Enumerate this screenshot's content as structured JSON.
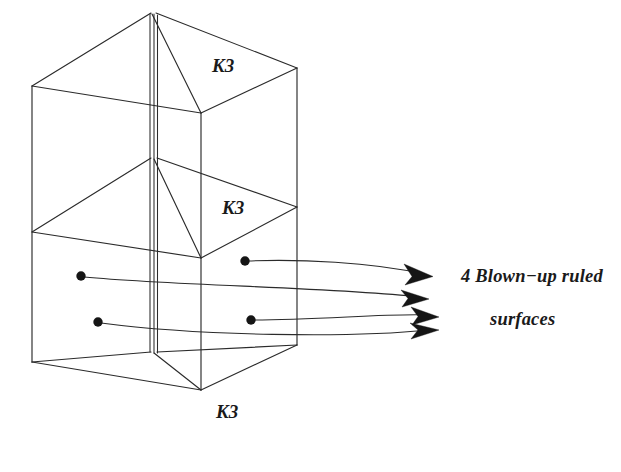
{
  "figure": {
    "name": "blown-up-ruled-surfaces-degeneration-diagram",
    "background_color": "#ffffff",
    "ink_color": "#2b2b2b",
    "width": 621,
    "height": 472
  },
  "labels": {
    "k3_top": "K3",
    "k3_middle": "K3",
    "k3_bottom": "K3",
    "callout_line1": "4 Blown−up ruled",
    "callout_line2": "surfaces"
  },
  "annotation": {
    "count": 4,
    "dot_count": 4,
    "arrow_count": 4,
    "dots": [
      {
        "id": "dot-upper-right",
        "x": 245,
        "y": 261
      },
      {
        "id": "dot-upper-left",
        "x": 81,
        "y": 276
      },
      {
        "id": "dot-lower-left",
        "x": 98,
        "y": 322
      },
      {
        "id": "dot-lower-right",
        "x": 251,
        "y": 320
      }
    ],
    "arrow_tips": [
      {
        "id": "arrow-tip-1",
        "x": 431,
        "y": 275
      },
      {
        "id": "arrow-tip-2",
        "x": 427,
        "y": 298
      },
      {
        "id": "arrow-tip-3",
        "x": 437,
        "y": 316
      },
      {
        "id": "arrow-tip-4",
        "x": 437,
        "y": 330
      }
    ]
  },
  "geometry": {
    "description": "Three-tier degenerate threefold: tent-roof top, mid rhombus section, tent-floor bottom",
    "apex_top": {
      "x": 153,
      "y": 13
    },
    "left_upper": {
      "x": 32,
      "y": 86
    },
    "right_upper": {
      "x": 297,
      "y": 68
    },
    "front_upper": {
      "x": 201,
      "y": 113
    },
    "left_lower": {
      "x": 32,
      "y": 362
    },
    "right_lower": {
      "x": 297,
      "y": 345
    },
    "front_lower": {
      "x": 201,
      "y": 390
    },
    "mid_apex": {
      "x": 153,
      "y": 158
    },
    "mid_front": {
      "x": 201,
      "y": 258
    },
    "bottom_apex": {
      "x": 153,
      "y": 352
    }
  }
}
